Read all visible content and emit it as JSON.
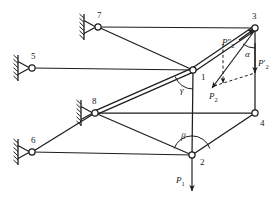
{
  "diagram": {
    "stroke_color": "#1d1d1d",
    "background": "#ffffff",
    "nodes": [
      {
        "id": "1",
        "label": "1",
        "x": 193,
        "y": 70,
        "label_x": 201,
        "label_y": 73,
        "type": "joint"
      },
      {
        "id": "2",
        "label": "2",
        "x": 192,
        "y": 155,
        "label_x": 200,
        "label_y": 158,
        "type": "joint"
      },
      {
        "id": "3",
        "label": "3",
        "x": 255,
        "y": 28,
        "label_x": 252,
        "label_y": 12,
        "type": "joint"
      },
      {
        "id": "4",
        "label": "4",
        "x": 255,
        "y": 113,
        "label_x": 260,
        "label_y": 119,
        "type": "joint"
      },
      {
        "id": "5",
        "label": "5",
        "x": 32,
        "y": 68,
        "label_x": 31,
        "label_y": 52,
        "type": "pin-support"
      },
      {
        "id": "6",
        "label": "6",
        "x": 32,
        "y": 152,
        "label_x": 31,
        "label_y": 136,
        "type": "pin-support"
      },
      {
        "id": "7",
        "label": "7",
        "x": 98,
        "y": 27,
        "label_x": 97,
        "label_y": 11,
        "type": "pin-support"
      },
      {
        "id": "8",
        "label": "8",
        "x": 95,
        "y": 113,
        "label_x": 92,
        "label_y": 97,
        "type": "pin-support"
      }
    ],
    "members": [
      {
        "name": "member-7-3",
        "from": "7",
        "to": "3",
        "style": "single"
      },
      {
        "name": "member-7-1",
        "from": "7",
        "to": "1",
        "style": "single"
      },
      {
        "name": "member-5-1",
        "from": "5",
        "to": "1",
        "style": "single"
      },
      {
        "name": "member-1-3",
        "from": "1",
        "to": "3",
        "style": "double"
      },
      {
        "name": "member-8-1",
        "from": "8",
        "to": "1",
        "style": "double"
      },
      {
        "name": "member-8-4",
        "from": "8",
        "to": "4",
        "style": "single"
      },
      {
        "name": "member-8-2",
        "from": "8",
        "to": "2",
        "style": "single"
      },
      {
        "name": "member-6-8",
        "from": "6",
        "to": "8",
        "style": "single"
      },
      {
        "name": "member-6-2",
        "from": "6",
        "to": "2",
        "style": "single"
      },
      {
        "name": "member-1-2",
        "from": "1",
        "to": "2",
        "style": "single"
      },
      {
        "name": "member-3-4",
        "from": "3",
        "to": "4",
        "style": "single"
      },
      {
        "name": "member-2-4",
        "from": "2",
        "to": "4",
        "style": "single"
      }
    ],
    "angles": [
      {
        "name": "angle-gamma",
        "label": "γ",
        "at_node": "1",
        "label_x": 180,
        "label_y": 86
      },
      {
        "name": "angle-beta",
        "label": "β",
        "at_node": "2",
        "label_x": 181,
        "label_y": 132
      },
      {
        "name": "angle-alpha",
        "label": "α",
        "at_node": "3",
        "label_x": 245,
        "label_y": 50
      }
    ],
    "forces": [
      {
        "name": "force-p1",
        "label": "P",
        "sub": "1",
        "prime": "",
        "from_x": 192,
        "from_y": 157,
        "to_x": 192,
        "to_y": 191,
        "dashed": false,
        "label_x": 176,
        "label_y": 176
      },
      {
        "name": "force-p2",
        "label": "P",
        "sub": "2",
        "prime": "",
        "from_x": 255,
        "from_y": 30,
        "to_x": 212,
        "to_y": 88,
        "dashed": false,
        "label_x": 209,
        "label_y": 92
      },
      {
        "name": "force-p2-double-prime",
        "label": "P",
        "sub": "2",
        "prime": "″",
        "from_x": 223,
        "from_y": 44,
        "to_x": 223,
        "to_y": 83,
        "dashed": true,
        "label_x": 222,
        "label_y": 38
      },
      {
        "name": "force-p2-prime",
        "label": "P",
        "sub": "2",
        "prime": "′",
        "from_x": 255,
        "from_y": 43,
        "to_x": 255,
        "to_y": 73,
        "dashed": false,
        "label_x": 258,
        "label_y": 59
      },
      {
        "name": "force-p2-resolution-link",
        "label": "",
        "sub": "",
        "prime": "",
        "from_x": 214,
        "from_y": 86,
        "to_x": 255,
        "to_y": 73,
        "dashed": true,
        "label_x": 0,
        "label_y": 0
      }
    ],
    "member-arrow": {
      "name": "member-force-arrow-to-3",
      "tip_x": 255,
      "tip_y": 29
    }
  }
}
